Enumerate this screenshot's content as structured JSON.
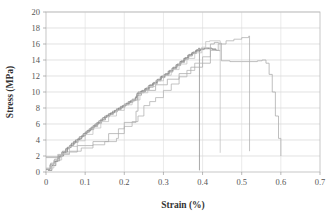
{
  "chart_data": {
    "type": "line",
    "title": "",
    "xlabel": "Strain (%)",
    "ylabel": "Stress (MPa)",
    "xlim": [
      0,
      0.7
    ],
    "ylim": [
      0,
      20
    ],
    "xticks": [
      0,
      0.1,
      0.2,
      0.3,
      0.4,
      0.5,
      0.6,
      0.7
    ],
    "xticklabels": [
      "0",
      "0.1",
      "0.2",
      "0.3",
      "0.4",
      "0.5",
      "0.6",
      "0.7"
    ],
    "yticks": [
      0,
      2,
      4,
      6,
      8,
      10,
      12,
      14,
      16,
      18,
      20
    ],
    "yticklabels": [
      "0",
      "2",
      "4",
      "6",
      "8",
      "10",
      "12",
      "14",
      "16",
      "18",
      "20"
    ],
    "grid": "horizontal-and-vertical-light",
    "legend": "none",
    "plot_border": true,
    "series": [
      {
        "name": "specimen-1",
        "color": "#8c8c8c",
        "points": [
          [
            0.0,
            0.3
          ],
          [
            0.01,
            0.9
          ],
          [
            0.02,
            1.3
          ],
          [
            0.03,
            1.9
          ],
          [
            0.04,
            2.4
          ],
          [
            0.05,
            2.9
          ],
          [
            0.06,
            3.3
          ],
          [
            0.07,
            3.8
          ],
          [
            0.08,
            4.1
          ],
          [
            0.09,
            4.5
          ],
          [
            0.1,
            5.0
          ],
          [
            0.11,
            5.4
          ],
          [
            0.12,
            5.8
          ],
          [
            0.13,
            6.2
          ],
          [
            0.14,
            6.6
          ],
          [
            0.15,
            7.0
          ],
          [
            0.16,
            7.3
          ],
          [
            0.17,
            7.6
          ],
          [
            0.18,
            7.9
          ],
          [
            0.19,
            8.2
          ],
          [
            0.2,
            8.5
          ],
          [
            0.21,
            8.8
          ],
          [
            0.22,
            9.1
          ],
          [
            0.23,
            9.5
          ],
          [
            0.235,
            10.0
          ],
          [
            0.245,
            10.2
          ],
          [
            0.255,
            10.5
          ],
          [
            0.265,
            10.9
          ],
          [
            0.275,
            11.2
          ],
          [
            0.285,
            11.6
          ],
          [
            0.295,
            12.0
          ],
          [
            0.305,
            12.3
          ],
          [
            0.315,
            12.7
          ],
          [
            0.325,
            13.1
          ],
          [
            0.335,
            13.5
          ],
          [
            0.345,
            13.9
          ],
          [
            0.355,
            14.3
          ],
          [
            0.365,
            14.7
          ],
          [
            0.375,
            15.0
          ],
          [
            0.385,
            15.3
          ],
          [
            0.39,
            15.5
          ],
          [
            0.392,
            12.0
          ],
          [
            0.392,
            6.0
          ],
          [
            0.392,
            0.2
          ]
        ]
      },
      {
        "name": "specimen-2",
        "color": "#7d7d7d",
        "points": [
          [
            0.005,
            0.2
          ],
          [
            0.015,
            0.8
          ],
          [
            0.025,
            1.4
          ],
          [
            0.035,
            2.0
          ],
          [
            0.045,
            2.5
          ],
          [
            0.055,
            3.1
          ],
          [
            0.065,
            3.6
          ],
          [
            0.075,
            4.0
          ],
          [
            0.085,
            4.4
          ],
          [
            0.095,
            4.8
          ],
          [
            0.105,
            5.2
          ],
          [
            0.115,
            5.6
          ],
          [
            0.125,
            6.0
          ],
          [
            0.135,
            6.4
          ],
          [
            0.145,
            6.8
          ],
          [
            0.155,
            7.1
          ],
          [
            0.165,
            7.4
          ],
          [
            0.175,
            7.7
          ],
          [
            0.185,
            8.0
          ],
          [
            0.195,
            8.3
          ],
          [
            0.205,
            8.6
          ],
          [
            0.215,
            8.9
          ],
          [
            0.228,
            9.3
          ],
          [
            0.232,
            9.8
          ],
          [
            0.242,
            10.1
          ],
          [
            0.252,
            10.4
          ],
          [
            0.262,
            10.8
          ],
          [
            0.272,
            11.1
          ],
          [
            0.282,
            11.5
          ],
          [
            0.292,
            11.9
          ],
          [
            0.302,
            12.2
          ],
          [
            0.312,
            12.6
          ],
          [
            0.322,
            13.0
          ],
          [
            0.332,
            13.4
          ],
          [
            0.342,
            13.8
          ],
          [
            0.352,
            14.2
          ],
          [
            0.362,
            14.6
          ],
          [
            0.372,
            14.9
          ],
          [
            0.382,
            15.2
          ],
          [
            0.395,
            15.4
          ],
          [
            0.405,
            15.5
          ],
          [
            0.415,
            15.4
          ],
          [
            0.425,
            15.3
          ],
          [
            0.435,
            15.3
          ]
        ]
      },
      {
        "name": "specimen-3",
        "color": "#9a9a9a",
        "points": [
          [
            0.0,
            0.4
          ],
          [
            0.012,
            1.1
          ],
          [
            0.022,
            1.6
          ],
          [
            0.032,
            2.1
          ],
          [
            0.042,
            2.6
          ],
          [
            0.052,
            3.0
          ],
          [
            0.062,
            3.4
          ],
          [
            0.072,
            3.7
          ],
          [
            0.082,
            4.2
          ],
          [
            0.092,
            4.6
          ],
          [
            0.102,
            5.0
          ],
          [
            0.112,
            5.3
          ],
          [
            0.122,
            5.7
          ],
          [
            0.132,
            6.1
          ],
          [
            0.142,
            6.5
          ],
          [
            0.152,
            6.9
          ],
          [
            0.162,
            7.2
          ],
          [
            0.172,
            7.5
          ],
          [
            0.182,
            7.8
          ],
          [
            0.192,
            8.1
          ],
          [
            0.202,
            8.4
          ],
          [
            0.212,
            8.7
          ],
          [
            0.222,
            9.0
          ],
          [
            0.234,
            9.6
          ],
          [
            0.244,
            10.0
          ],
          [
            0.254,
            10.3
          ],
          [
            0.264,
            10.6
          ],
          [
            0.274,
            11.0
          ],
          [
            0.284,
            11.4
          ],
          [
            0.294,
            11.8
          ],
          [
            0.304,
            12.1
          ],
          [
            0.314,
            12.5
          ],
          [
            0.324,
            12.9
          ],
          [
            0.334,
            13.3
          ],
          [
            0.344,
            13.7
          ],
          [
            0.354,
            14.1
          ],
          [
            0.364,
            14.5
          ],
          [
            0.374,
            14.8
          ],
          [
            0.384,
            15.1
          ],
          [
            0.394,
            15.3
          ],
          [
            0.404,
            15.4
          ],
          [
            0.414,
            15.5
          ],
          [
            0.424,
            15.4
          ],
          [
            0.434,
            15.2
          ],
          [
            0.444,
            15.1
          ]
        ]
      },
      {
        "name": "specimen-4",
        "color": "#b0b0b0",
        "points": [
          [
            0.0,
            1.8
          ],
          [
            0.03,
            2.2
          ],
          [
            0.06,
            2.6
          ],
          [
            0.09,
            3.0
          ],
          [
            0.12,
            3.4
          ],
          [
            0.15,
            3.8
          ],
          [
            0.18,
            4.2
          ],
          [
            0.185,
            5.4
          ],
          [
            0.2,
            5.7
          ],
          [
            0.22,
            6.3
          ],
          [
            0.235,
            7.0
          ],
          [
            0.25,
            8.3
          ],
          [
            0.265,
            8.8
          ],
          [
            0.28,
            9.3
          ],
          [
            0.3,
            10.2
          ],
          [
            0.32,
            11.0
          ],
          [
            0.34,
            11.9
          ],
          [
            0.36,
            12.7
          ],
          [
            0.38,
            13.6
          ],
          [
            0.4,
            14.4
          ],
          [
            0.42,
            15.2
          ],
          [
            0.44,
            16.0
          ],
          [
            0.46,
            16.4
          ],
          [
            0.48,
            16.6
          ],
          [
            0.5,
            16.8
          ],
          [
            0.518,
            17.0
          ],
          [
            0.52,
            14.0
          ],
          [
            0.52,
            8.0
          ],
          [
            0.52,
            2.6
          ]
        ]
      },
      {
        "name": "specimen-5",
        "color": "#aaaaaa",
        "points": [
          [
            0.0,
            1.9
          ],
          [
            0.04,
            2.5
          ],
          [
            0.08,
            3.3
          ],
          [
            0.12,
            3.8
          ],
          [
            0.16,
            4.8
          ],
          [
            0.2,
            6.2
          ],
          [
            0.23,
            7.6
          ],
          [
            0.235,
            9.9
          ],
          [
            0.25,
            10.2
          ],
          [
            0.28,
            10.9
          ],
          [
            0.31,
            11.6
          ],
          [
            0.34,
            12.3
          ],
          [
            0.37,
            13.1
          ],
          [
            0.4,
            13.6
          ],
          [
            0.42,
            16.0
          ],
          [
            0.43,
            16.2
          ],
          [
            0.44,
            16.1
          ],
          [
            0.448,
            13.9
          ],
          [
            0.47,
            13.8
          ],
          [
            0.5,
            13.8
          ],
          [
            0.52,
            13.8
          ],
          [
            0.54,
            13.9
          ],
          [
            0.552,
            14.0
          ],
          [
            0.562,
            13.6
          ],
          [
            0.57,
            12.2
          ],
          [
            0.578,
            10.0
          ],
          [
            0.586,
            7.0
          ],
          [
            0.594,
            4.2
          ],
          [
            0.6,
            2.0
          ]
        ]
      },
      {
        "name": "specimen-6",
        "color": "#c0c0c0",
        "points": [
          [
            0.0,
            0.5
          ],
          [
            0.02,
            1.5
          ],
          [
            0.04,
            2.3
          ],
          [
            0.06,
            3.2
          ],
          [
            0.08,
            3.9
          ],
          [
            0.1,
            4.7
          ],
          [
            0.12,
            5.5
          ],
          [
            0.14,
            6.3
          ],
          [
            0.16,
            7.0
          ],
          [
            0.18,
            7.7
          ],
          [
            0.2,
            8.4
          ],
          [
            0.22,
            9.0
          ],
          [
            0.24,
            9.9
          ],
          [
            0.26,
            10.7
          ],
          [
            0.28,
            11.4
          ],
          [
            0.3,
            12.1
          ],
          [
            0.32,
            12.8
          ],
          [
            0.34,
            13.5
          ],
          [
            0.36,
            14.2
          ],
          [
            0.38,
            14.9
          ],
          [
            0.398,
            15.6
          ],
          [
            0.408,
            16.3
          ],
          [
            0.418,
            16.4
          ],
          [
            0.445,
            16.4
          ],
          [
            0.445,
            13.0
          ],
          [
            0.445,
            7.0
          ],
          [
            0.445,
            2.4
          ]
        ]
      }
    ]
  }
}
